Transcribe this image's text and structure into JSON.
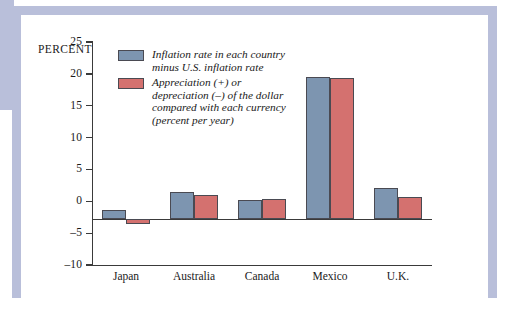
{
  "chart_data": {
    "type": "bar",
    "title": "",
    "subtitle": "",
    "xlabel": "",
    "ylabel": "PERCENT",
    "ylim": [
      -10,
      25
    ],
    "yticks": [
      25,
      20,
      15,
      10,
      5,
      0,
      -5,
      -10
    ],
    "ytick_labels": [
      "25",
      "20",
      "15",
      "10",
      "5",
      "0",
      "–5",
      "–10"
    ],
    "grid": false,
    "legend_position": "inside-top-left",
    "categories": [
      "Japan",
      "Australia",
      "Canada",
      "Mexico",
      "U.K."
    ],
    "series": [
      {
        "name": "Inflation rate in each country minus U.S. inflation rate",
        "color": "#7d95b0",
        "values": [
          -1.3,
          1.5,
          0.2,
          19.5,
          2.1
        ]
      },
      {
        "name": "Appreciation (+) or depreciation (–) of the dollar compared with each currency (percent per year)",
        "color": "#d4716f",
        "values": [
          -3.6,
          1.0,
          0.4,
          19.4,
          0.7
        ]
      }
    ],
    "legend": [
      {
        "swatch_color": "#7d95b0",
        "lines": [
          "Inflation rate in each country",
          "minus U.S. inflation rate"
        ]
      },
      {
        "swatch_color": "#d4716f",
        "lines": [
          "Appreciation (+) or",
          "depreciation (–) of the dollar",
          "compared with each currency",
          "(percent per year)"
        ]
      }
    ]
  },
  "style": {
    "frame_color": "#b9bfda",
    "axis_color": "#3a3a3a",
    "bar_outline": "#4a4a52",
    "page_background": "#ffffff"
  }
}
